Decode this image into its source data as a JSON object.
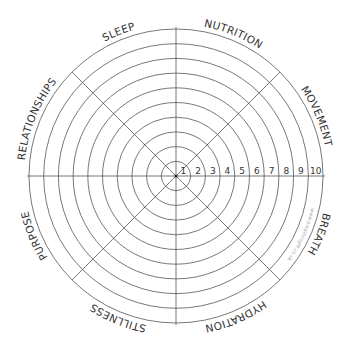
{
  "diagram": {
    "type": "wheel-of-wellness",
    "center": [
      176,
      176
    ],
    "ring_count": 10,
    "ring_spacing": 14.7,
    "scale_numbers": [
      "1",
      "2",
      "3",
      "4",
      "5",
      "6",
      "7",
      "8",
      "9",
      "10"
    ],
    "segments": [
      {
        "label": "SLEEP",
        "angle": -22
      },
      {
        "label": "NUTRITION",
        "angle": 22
      },
      {
        "label": "MOVEMENT",
        "angle": 67
      },
      {
        "label": "BREATH",
        "angle": 112
      },
      {
        "label": "HYDRATION",
        "angle": 157
      },
      {
        "label": "STILLNESS",
        "angle": 202
      },
      {
        "label": "PURPOSE",
        "angle": 247
      },
      {
        "label": "RELATIONSHIPS",
        "angle": 292
      }
    ],
    "watermark": "www.breathingfit.co.uk",
    "colors": {
      "line": "#555555",
      "text": "#333333",
      "watermark": "#aaaaaa"
    }
  }
}
